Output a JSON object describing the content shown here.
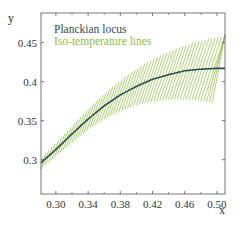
{
  "chart_data": {
    "type": "line",
    "title": "",
    "xlabel": "x",
    "ylabel": "y",
    "xlim": [
      0.2815,
      0.51
    ],
    "ylim": [
      0.256,
      0.488
    ],
    "xticks": [
      0.3,
      0.34,
      0.38,
      0.42,
      0.46,
      0.5
    ],
    "xtick_labels": [
      "0.30",
      "0.34",
      "0.38",
      "0.42",
      "0.46",
      "0.50"
    ],
    "yticks": [
      0.3,
      0.35,
      0.4,
      0.45
    ],
    "ytick_labels": [
      "0.3",
      "0.35",
      "0.4",
      "0.45"
    ],
    "grid": false,
    "legend_position": "upper left",
    "legend": [
      "Planckian locus",
      "Iso-temperature lines"
    ],
    "series": [
      {
        "name": "Planckian locus",
        "color": "#2f4f4f",
        "x": [
          0.2815,
          0.3,
          0.32,
          0.34,
          0.36,
          0.38,
          0.4,
          0.42,
          0.44,
          0.46,
          0.48,
          0.5,
          0.51
        ],
        "y": [
          0.296,
          0.313,
          0.333,
          0.352,
          0.369,
          0.383,
          0.394,
          0.403,
          0.409,
          0.414,
          0.416,
          0.417,
          0.417
        ]
      },
      {
        "name": "Iso-temperature lines",
        "color": "#8cbf3f",
        "count": 60,
        "description": "Short line segments crossing the locus, lengthening toward higher x"
      }
    ]
  },
  "legend": {
    "locus_label": "Planckian locus",
    "iso_label": "Iso-temperature lines",
    "locus_color": "#2f4f4f",
    "iso_color": "#8cbf3f"
  },
  "axes": {
    "x_label": "x",
    "y_label": "y"
  }
}
